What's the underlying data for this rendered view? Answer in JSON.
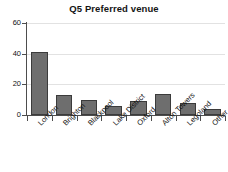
{
  "chart_data": {
    "type": "bar",
    "title": "Q5 Preferred venue",
    "xlabel": "",
    "ylabel": "",
    "categories": [
      "London",
      "Brighton",
      "Blackpool",
      "Lake District",
      "Oxford",
      "Alton Towers",
      "Legoland",
      "Other"
    ],
    "values": [
      41,
      13,
      10,
      6,
      9,
      14,
      8,
      4
    ],
    "ylim": [
      0,
      60
    ],
    "yticks": [
      0,
      20,
      40,
      60
    ],
    "ytick_labels": [
      "0",
      "20",
      "40",
      "60"
    ],
    "grid": true,
    "legend": false,
    "bar_color": "#6e6e6e",
    "bar_edge_color": "#3b3b3b",
    "axis_color": "#4d4d4d",
    "grid_color": "#e2e2e2",
    "background": "#ffffff"
  }
}
